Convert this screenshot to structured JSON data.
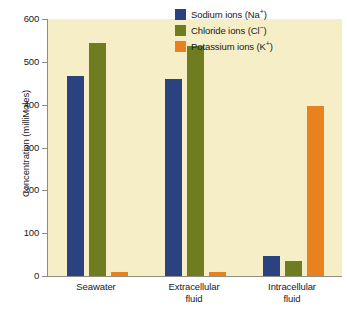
{
  "chart_data": {
    "type": "bar",
    "title": "",
    "xlabel": "",
    "ylabel": "Concentration (milliMoles)",
    "ylim": [
      0,
      600
    ],
    "yticks": [
      0,
      100,
      200,
      300,
      400,
      500,
      600
    ],
    "grid": false,
    "legend_position": "top-right",
    "categories": [
      "Seawater",
      "Extracellular fluid",
      "Intracellular fluid"
    ],
    "category_lines": [
      [
        "Seawater"
      ],
      [
        "Extracellular",
        "fluid"
      ],
      [
        "Intracellular",
        "fluid"
      ]
    ],
    "series": [
      {
        "name": "Sodium ions (Na+)",
        "name_base": "Sodium ions (Na",
        "name_sup": "+",
        "name_tail": ")",
        "color": "#2a4280",
        "values": [
          468,
          460,
          46
        ]
      },
      {
        "name": "Chloride ions (Cl-)",
        "name_base": "Chloride ions (Cl",
        "name_sup": "−",
        "name_tail": ")",
        "color": "#6f7c20",
        "values": [
          545,
          538,
          36
        ]
      },
      {
        "name": "Potassium ions (K+)",
        "name_base": "Potassium ions (K",
        "name_sup": "+",
        "name_tail": ")",
        "color": "#e8821e",
        "values": [
          10,
          9,
          397
        ]
      }
    ]
  },
  "colors": {
    "panel_background": "#f6eec6",
    "page_background": "#ffffff",
    "axis": "#8d8d80",
    "text": "#1a1a1a",
    "sodium": "#2a4280",
    "chloride": "#6f7c20",
    "potassium": "#e8821e"
  }
}
